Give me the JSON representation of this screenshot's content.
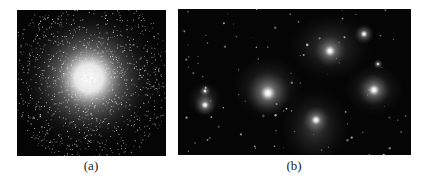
{
  "figure": {
    "panels": [
      {
        "id": "a",
        "label": "(a)",
        "subject": "globular star cluster",
        "description": "Dense spherical cluster of stars, bright white core fading into scattered points on black background",
        "colors": {
          "background": "#050505",
          "core": "#ffffff",
          "stars": "#d8d8d8"
        }
      },
      {
        "id": "b",
        "label": "(b)",
        "subject": "open star cluster with reflection nebulosity",
        "description": "Several bright stars with diffuse glowing halos and faint background stars on black background",
        "colors": {
          "background": "#050505",
          "halo": "#8a8a8a",
          "stars": "#ffffff"
        }
      }
    ]
  }
}
